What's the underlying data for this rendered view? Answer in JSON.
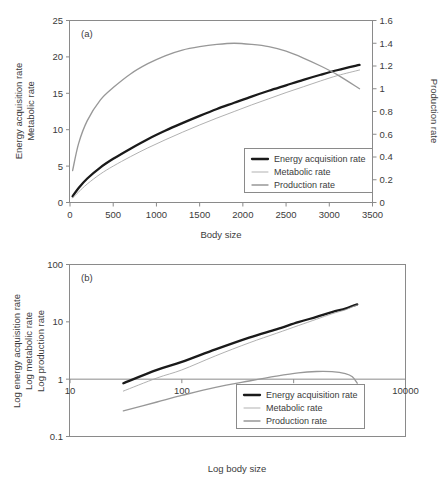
{
  "figure": {
    "background": "#ffffff",
    "colors": {
      "energy": "#1a1a1a",
      "metabolic": "#a8a8a8",
      "production": "#989898",
      "axis": "#8a8a8a",
      "text": "#3b3b3b"
    }
  },
  "legend_labels": {
    "energy": "Energy acquisition rate",
    "metabolic": "Metabolic rate",
    "production": "Production rate"
  },
  "chart_data": [
    {
      "id": "panel-a",
      "type": "line",
      "panel_label": "(a)",
      "title": "",
      "xlabel": "Body size",
      "ylabel_lines": [
        "Energy acquisition rate",
        "Metabolic rate"
      ],
      "y2label": "Production rate",
      "xlim": [
        0,
        3500
      ],
      "ylim": [
        0,
        25
      ],
      "y2lim": [
        0,
        1.6
      ],
      "xticks": [
        0,
        500,
        1000,
        1500,
        2000,
        2500,
        3000,
        3500
      ],
      "xticklabels": [
        "0",
        "500",
        "1000",
        "1500",
        "2000",
        "2500",
        "3000",
        "3500"
      ],
      "yticks": [
        0,
        5,
        10,
        15,
        20,
        25
      ],
      "yticklabels": [
        "0",
        "5",
        "10",
        "15",
        "20",
        "25"
      ],
      "y2ticks": [
        0,
        0.2,
        0.4,
        0.6,
        0.8,
        1.0,
        1.2,
        1.4,
        1.6
      ],
      "y2ticklabels": [
        "0",
        "0.2",
        "0.4",
        "0.6",
        "0.8",
        "1",
        "1.2",
        "1.4",
        "1.6"
      ],
      "grid": false,
      "legend_position": "lower-right",
      "x": [
        30,
        100,
        200,
        350,
        500,
        700,
        900,
        1100,
        1300,
        1500,
        1700,
        1900,
        2100,
        2300,
        2500,
        2700,
        2900,
        3100,
        3350
      ],
      "series": [
        {
          "name": "Energy acquisition rate",
          "axis": "left",
          "values": [
            0.85,
            2.0,
            3.3,
            4.8,
            6.0,
            7.4,
            8.7,
            9.85,
            10.9,
            11.9,
            12.85,
            13.7,
            14.55,
            15.35,
            16.1,
            16.85,
            17.55,
            18.2,
            18.9
          ]
        },
        {
          "name": "Metabolic rate",
          "axis": "left",
          "values": [
            0.62,
            1.45,
            2.55,
            3.9,
            5.0,
            6.3,
            7.5,
            8.6,
            9.65,
            10.65,
            11.6,
            12.5,
            13.4,
            14.25,
            15.1,
            15.9,
            16.7,
            17.45,
            18.2
          ]
        },
        {
          "name": "Production rate",
          "axis": "right",
          "values": [
            0.28,
            0.52,
            0.72,
            0.9,
            1.01,
            1.13,
            1.22,
            1.29,
            1.34,
            1.37,
            1.39,
            1.4,
            1.39,
            1.37,
            1.33,
            1.27,
            1.2,
            1.12,
            1.0
          ]
        }
      ]
    },
    {
      "id": "panel-b",
      "type": "line",
      "panel_label": "(b)",
      "title": "",
      "xlabel": "Log body size",
      "ylabel_lines": [
        "Log energy acquisition rate",
        "Log metabolic rate",
        "Log production rate"
      ],
      "xlim": [
        10,
        10000
      ],
      "ylim": [
        0.1,
        100
      ],
      "xscale": "log",
      "yscale": "log",
      "xticks": [
        10,
        100,
        1000,
        10000
      ],
      "xticklabels": [
        "10",
        "100",
        "1000",
        "10000"
      ],
      "yticks": [
        0.1,
        1,
        10,
        100
      ],
      "yticklabels": [
        "0.1",
        "1",
        "10",
        "100"
      ],
      "grid": false,
      "legend_position": "lower-right",
      "x": [
        30,
        60,
        100,
        200,
        400,
        700,
        1100,
        1600,
        2200,
        2900,
        3350,
        3700
      ],
      "series": [
        {
          "name": "Energy acquisition rate",
          "values": [
            0.85,
            1.45,
            2.0,
            3.3,
            5.3,
            7.4,
            9.85,
            12.2,
            14.8,
            17.0,
            18.9,
            20.2
          ]
        },
        {
          "name": "Metabolic rate",
          "values": [
            0.62,
            1.05,
            1.45,
            2.55,
            4.3,
            6.3,
            8.6,
            11.1,
            13.8,
            16.2,
            18.2,
            19.6
          ]
        },
        {
          "name": "Production rate",
          "values": [
            0.28,
            0.4,
            0.52,
            0.72,
            0.93,
            1.13,
            1.29,
            1.36,
            1.35,
            1.25,
            1.1,
            0.85
          ]
        }
      ]
    }
  ]
}
